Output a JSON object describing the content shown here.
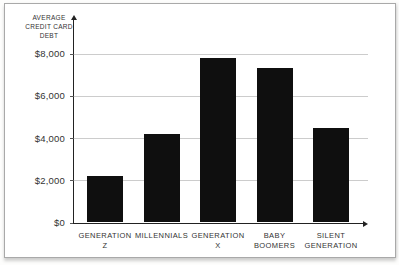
{
  "chart_data": {
    "type": "bar",
    "title": "",
    "y_axis_title": "AVERAGE CREDIT CARD DEBT",
    "y_axis_title_lines": [
      "AVERAGE",
      "CREDIT CARD",
      "DEBT"
    ],
    "categories": [
      "GENERATION Z",
      "MILLENNIALS",
      "GENERATION X",
      "BABY BOOMERS",
      "SILENT GENERATION"
    ],
    "category_label_lines": [
      [
        "GENERATION",
        "Z"
      ],
      [
        "MILLENNIALS"
      ],
      [
        "GENERATION",
        "X"
      ],
      [
        "BABY",
        "BOOMERS"
      ],
      [
        "SILENT",
        "GENERATION"
      ]
    ],
    "values": [
      2200,
      4200,
      7800,
      7300,
      4450
    ],
    "xlabel": "",
    "ylabel": "AVERAGE CREDIT CARD DEBT",
    "ylim": [
      0,
      8000
    ],
    "yticks": [
      {
        "value": 8000,
        "label": "$8,000"
      },
      {
        "value": 6000,
        "label": "$6,000"
      },
      {
        "value": 4000,
        "label": "$4,000"
      },
      {
        "value": 2000,
        "label": "$2,000"
      },
      {
        "value": 0,
        "label": "$0"
      }
    ],
    "grid": true,
    "legend": "none",
    "bar_color": "#0f0f0f",
    "axis_color": "#222222",
    "gridline_color": "#cccccc",
    "text_color": "#333333",
    "frame_border_color": "#a9a9a9",
    "background_color": "#ffffff"
  }
}
